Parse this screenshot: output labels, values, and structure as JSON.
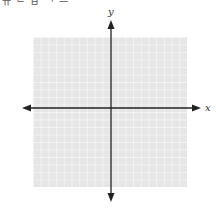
{
  "header": {
    "cropped_text": "ㅠ ᄂ ㅂ ᄀ ㅡ"
  },
  "plane": {
    "x_label": "x",
    "y_label": "y",
    "grid": {
      "cells_x": 20,
      "cells_y": 20,
      "color": "#e9e9e9",
      "line_color": "#ffffff"
    },
    "axis_color": "#222222"
  }
}
